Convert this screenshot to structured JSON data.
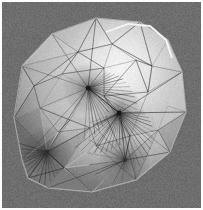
{
  "figure": {
    "title": "3D triangulated mesh surface render",
    "kind": "grayscale-3d-render",
    "width_px": 203,
    "height_px": 210,
    "background_color": "#6e6e6e",
    "border_color": "#fdfdfd",
    "border_width_px": 2,
    "shading": {
      "model": "gouraud-specular",
      "highlight_color": "#f2f2f2",
      "midtone_color": "#b0b0b0",
      "shadow_color": "#3a3a3a",
      "highlight_center_x": 120,
      "highlight_center_y": 70,
      "highlight_radius": 78
    },
    "wireframe": {
      "edge_color": "#2b2b2b",
      "edge_color_light": "#d8d8d8",
      "edge_width_px": 0.5,
      "visible": true
    },
    "silhouette": [
      [
        22,
        160
      ],
      [
        14,
        118
      ],
      [
        22,
        66
      ],
      [
        52,
        34
      ],
      [
        96,
        18
      ],
      [
        140,
        22
      ],
      [
        168,
        40
      ],
      [
        182,
        72
      ],
      [
        186,
        112
      ],
      [
        170,
        152
      ],
      [
        136,
        180
      ],
      [
        92,
        192
      ],
      [
        48,
        188
      ],
      [
        28,
        178
      ]
    ],
    "fan_vertices": [
      {
        "name": "upper-fan-vertex",
        "x": 88,
        "y": 88,
        "spokes": 22,
        "darkness": "#1c1c1c"
      },
      {
        "name": "lower-fan-vertex",
        "x": 119,
        "y": 113,
        "spokes": 26,
        "darkness": "#141414"
      },
      {
        "name": "left-fan-vertex",
        "x": 47,
        "y": 152,
        "spokes": 14,
        "darkness": "#333333"
      },
      {
        "name": "bottom-fan-vertex",
        "x": 125,
        "y": 160,
        "spokes": 10,
        "darkness": "#3a3a3a"
      }
    ],
    "ridge_highlight": {
      "name": "top-right-fold",
      "points": [
        [
          106,
          32
        ],
        [
          128,
          24
        ],
        [
          150,
          26
        ],
        [
          166,
          40
        ],
        [
          172,
          58
        ]
      ],
      "color": "#eaeaea"
    },
    "mesh_vertices": [
      [
        22,
        160
      ],
      [
        14,
        118
      ],
      [
        22,
        66
      ],
      [
        52,
        34
      ],
      [
        96,
        18
      ],
      [
        140,
        22
      ],
      [
        168,
        40
      ],
      [
        182,
        72
      ],
      [
        186,
        112
      ],
      [
        170,
        152
      ],
      [
        136,
        180
      ],
      [
        92,
        192
      ],
      [
        48,
        188
      ],
      [
        28,
        178
      ],
      [
        62,
        74
      ],
      [
        88,
        88
      ],
      [
        119,
        113
      ],
      [
        47,
        152
      ],
      [
        125,
        160
      ],
      [
        70,
        120
      ],
      [
        104,
        68
      ],
      [
        148,
        92
      ],
      [
        158,
        130
      ],
      [
        96,
        146
      ],
      [
        64,
        168
      ],
      [
        40,
        108
      ],
      [
        112,
        44
      ],
      [
        136,
        60
      ],
      [
        78,
        52
      ],
      [
        152,
        66
      ],
      [
        104,
        96
      ],
      [
        90,
        128
      ],
      [
        130,
        136
      ],
      [
        58,
        132
      ],
      [
        34,
        86
      ],
      [
        168,
        106
      ]
    ],
    "triangles": [
      [
        0,
        1,
        17
      ],
      [
        1,
        2,
        34
      ],
      [
        2,
        3,
        28
      ],
      [
        3,
        4,
        28
      ],
      [
        4,
        26,
        28
      ],
      [
        4,
        5,
        26
      ],
      [
        5,
        6,
        29
      ],
      [
        5,
        26,
        29
      ],
      [
        6,
        7,
        29
      ],
      [
        7,
        29,
        21
      ],
      [
        7,
        8,
        35
      ],
      [
        7,
        35,
        21
      ],
      [
        8,
        9,
        22
      ],
      [
        8,
        22,
        35
      ],
      [
        9,
        10,
        22
      ],
      [
        10,
        11,
        18
      ],
      [
        10,
        18,
        32
      ],
      [
        11,
        12,
        24
      ],
      [
        11,
        24,
        18
      ],
      [
        12,
        13,
        24
      ],
      [
        13,
        0,
        17
      ],
      [
        13,
        17,
        24
      ],
      [
        0,
        17,
        33
      ],
      [
        1,
        34,
        25
      ],
      [
        1,
        25,
        17
      ],
      [
        2,
        34,
        28
      ],
      [
        34,
        25,
        14
      ],
      [
        34,
        14,
        28
      ],
      [
        28,
        14,
        20
      ],
      [
        28,
        26,
        20
      ],
      [
        26,
        27,
        20
      ],
      [
        26,
        29,
        27
      ],
      [
        29,
        21,
        27
      ],
      [
        21,
        30,
        27
      ],
      [
        21,
        35,
        22
      ],
      [
        21,
        22,
        32
      ],
      [
        22,
        32,
        18
      ],
      [
        14,
        15,
        20
      ],
      [
        14,
        25,
        15
      ],
      [
        25,
        19,
        15
      ],
      [
        25,
        33,
        19
      ],
      [
        17,
        33,
        19
      ],
      [
        17,
        19,
        31
      ],
      [
        17,
        31,
        24
      ],
      [
        24,
        31,
        23
      ],
      [
        24,
        23,
        18
      ],
      [
        18,
        23,
        32
      ],
      [
        23,
        31,
        16
      ],
      [
        23,
        16,
        32
      ],
      [
        32,
        16,
        30
      ],
      [
        32,
        30,
        21
      ],
      [
        30,
        16,
        15
      ],
      [
        30,
        15,
        20
      ],
      [
        15,
        16,
        31
      ],
      [
        15,
        31,
        19
      ],
      [
        33,
        19,
        31
      ],
      [
        27,
        30,
        20
      ]
    ]
  },
  "labels": {
    "figure_caption": "",
    "axis_labels": [],
    "legend_entries": [],
    "annotations": []
  }
}
